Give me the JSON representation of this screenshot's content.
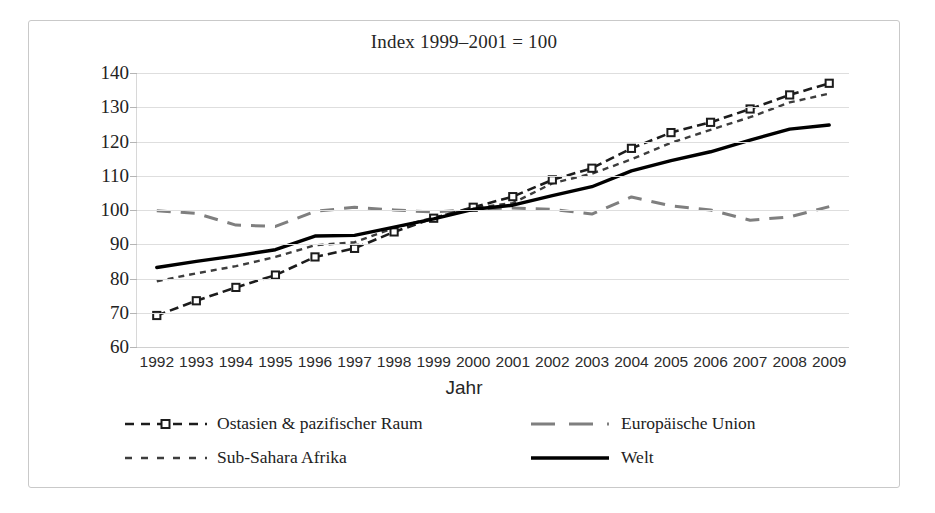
{
  "chart_data": {
    "type": "line",
    "title": "Index 1999–2001 = 100",
    "xlabel": "Jahr",
    "ylabel": "",
    "ylim": [
      60,
      140
    ],
    "yticks": [
      60,
      70,
      80,
      90,
      100,
      110,
      120,
      130,
      140
    ],
    "grid": true,
    "legend_position": "bottom",
    "categories": [
      1992,
      1993,
      1994,
      1995,
      1996,
      1997,
      1998,
      1999,
      2000,
      2001,
      2002,
      2003,
      2004,
      2005,
      2006,
      2007,
      2008,
      2009
    ],
    "x": [
      "1992",
      "1993",
      "1994",
      "1995",
      "1996",
      "1997",
      "1998",
      "1999",
      "2000",
      "2001",
      "2002",
      "2003",
      "2004",
      "2005",
      "2006",
      "2007",
      "2008",
      "2009"
    ],
    "series": [
      {
        "name": "Ostasien & pazifischer Raum",
        "style": "dashed-with-square-markers",
        "color": "#1c1c1c",
        "values": [
          69.2,
          73.5,
          77.4,
          81.0,
          86.3,
          88.8,
          93.6,
          97.6,
          100.8,
          103.9,
          108.8,
          112.2,
          118.0,
          122.6,
          125.6,
          129.5,
          133.6,
          137.0
        ]
      },
      {
        "name": "Sub-Sahara Afrika",
        "style": "fine-dashed",
        "color": "#3d3d3d",
        "values": [
          79.2,
          81.5,
          83.6,
          86.3,
          89.7,
          90.6,
          94.8,
          97.8,
          100.6,
          102.0,
          107.8,
          110.6,
          114.8,
          119.6,
          123.4,
          127.1,
          131.4,
          134.0
        ]
      },
      {
        "name": "Europäische Union",
        "style": "long-dashed",
        "color": "#7f7f7f",
        "values": [
          99.8,
          99.0,
          95.6,
          95.2,
          99.6,
          100.8,
          100.0,
          99.4,
          100.2,
          100.6,
          100.2,
          98.8,
          103.8,
          101.2,
          100.0,
          97.0,
          98.0,
          101.0
        ]
      },
      {
        "name": "Welt",
        "style": "solid-thick",
        "color": "#000000",
        "values": [
          83.2,
          85.0,
          86.6,
          88.4,
          92.4,
          92.6,
          95.0,
          97.4,
          100.2,
          101.4,
          104.2,
          106.8,
          111.4,
          114.4,
          117.0,
          120.4,
          123.6,
          124.8
        ]
      }
    ]
  },
  "axis": {
    "y_tick_labels": [
      "140",
      "130",
      "120",
      "110",
      "100",
      "90",
      "80",
      "70",
      "60"
    ],
    "x_tick_labels": [
      "1992",
      "1993",
      "1994",
      "1995",
      "1996",
      "1997",
      "1998",
      "1999",
      "2000",
      "2001",
      "2002",
      "2003",
      "2004",
      "2005",
      "2006",
      "2007",
      "2008",
      "2009"
    ],
    "x_title": "Jahr"
  },
  "legend": {
    "items": [
      {
        "label": "Ostasien & pazifischer Raum",
        "key": "dashed-square-marker-key"
      },
      {
        "label": "Europäische Union",
        "key": "long-dashed-key"
      },
      {
        "label": "Sub-Sahara Afrika",
        "key": "fine-dashed-key"
      },
      {
        "label": "Welt",
        "key": "solid-thick-key"
      }
    ]
  },
  "colors": {
    "ostasien": "#1c1c1c",
    "subsahara": "#3d3d3d",
    "eu": "#7f7f7f",
    "welt": "#000000",
    "grid": "#dedede",
    "frame": "#c9c9c9"
  }
}
